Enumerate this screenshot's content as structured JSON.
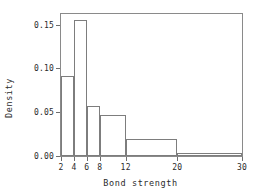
{
  "chart_data": {
    "type": "bar",
    "title": "",
    "subtitle": "",
    "xlabel": "Bond strength",
    "ylabel": "Density",
    "xlim": [
      2,
      30
    ],
    "ylim": [
      0.0,
      0.162
    ],
    "grid": false,
    "legend": null,
    "histogram": true,
    "bin_edges": [
      2,
      4,
      6,
      8,
      12,
      20,
      30
    ],
    "categories": [
      "2-4",
      "4-6",
      "6-8",
      "8-12",
      "12-20",
      "20-30"
    ],
    "values": [
      0.091,
      0.155,
      0.057,
      0.047,
      0.019,
      0.003
    ],
    "xticks": [
      2,
      4,
      6,
      8,
      12,
      20,
      30
    ],
    "xtick_labels": [
      "2",
      "4",
      "6",
      "8",
      "12",
      "20",
      "30"
    ],
    "yticks": [
      0.0,
      0.05,
      0.1,
      0.15
    ],
    "ytick_labels": [
      "0.00",
      "0.05",
      "0.10",
      "0.15"
    ],
    "colors": {
      "bar_edge": "#7d7d7d",
      "bar_fill": "transparent",
      "frame": "#8a8a8a",
      "text": "#2b2b2b",
      "background": "#ffffff"
    }
  }
}
